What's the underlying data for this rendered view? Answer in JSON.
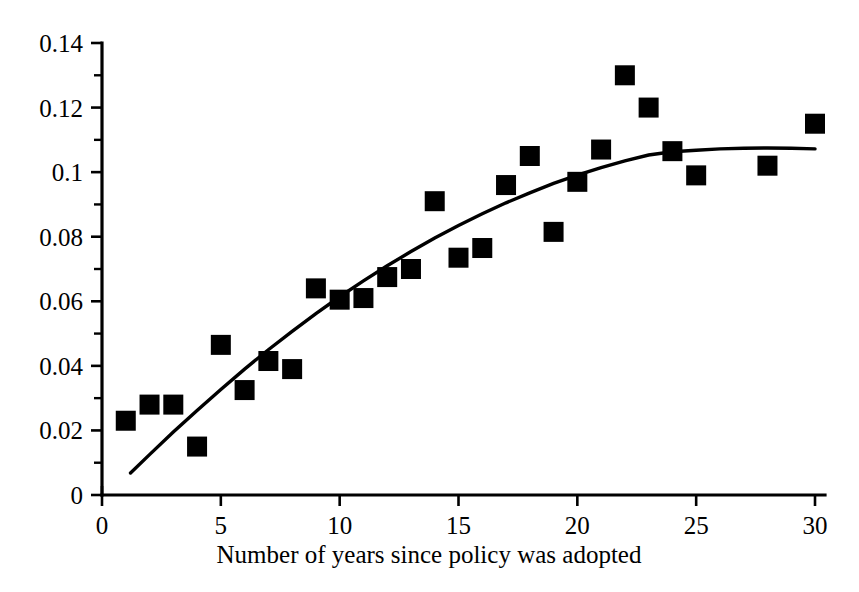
{
  "chart_data": {
    "type": "scatter",
    "title": "",
    "xlabel": "Number of years since policy was adopted",
    "ylabel": "",
    "xlim": [
      0,
      30
    ],
    "ylim": [
      0,
      0.14
    ],
    "grid": false,
    "legend": "none",
    "x_ticks": [
      0,
      5,
      10,
      15,
      20,
      25,
      30
    ],
    "x_tick_labels": [
      "0",
      "5",
      "10",
      "15",
      "20",
      "25",
      "30"
    ],
    "x_minor_ticks": [],
    "y_ticks": [
      0,
      0.02,
      0.04,
      0.06,
      0.08,
      0.1,
      0.12,
      0.14
    ],
    "y_tick_labels": [
      "0",
      "0.02",
      "0.04",
      "0.06",
      "0.08",
      "0.1",
      "0.12",
      "0.14"
    ],
    "y_minor_ticks": [
      0.01,
      0.03,
      0.05,
      0.07,
      0.09,
      0.11,
      0.13
    ],
    "marker_style": "filled-square",
    "marker_color": "#000000",
    "marker_size_px": 20,
    "x": [
      1,
      2,
      3,
      4,
      5,
      6,
      7,
      8,
      9,
      10,
      11,
      12,
      13,
      14,
      15,
      16,
      17,
      18,
      19,
      20,
      21,
      22,
      23,
      24,
      25,
      28,
      30
    ],
    "y": [
      0.023,
      0.028,
      0.028,
      0.015,
      0.0465,
      0.0325,
      0.0415,
      0.039,
      0.064,
      0.0605,
      0.061,
      0.0675,
      0.07,
      0.091,
      0.0735,
      0.0765,
      0.096,
      0.105,
      0.0815,
      0.097,
      0.107,
      0.13,
      0.12,
      0.1065,
      0.099,
      0.102,
      0.115
    ],
    "series": [
      {
        "name": "observations",
        "type": "scatter",
        "points": [
          {
            "x": 1,
            "y": 0.023
          },
          {
            "x": 2,
            "y": 0.028
          },
          {
            "x": 3,
            "y": 0.028
          },
          {
            "x": 4,
            "y": 0.015
          },
          {
            "x": 5,
            "y": 0.0465
          },
          {
            "x": 6,
            "y": 0.0325
          },
          {
            "x": 7,
            "y": 0.0415
          },
          {
            "x": 8,
            "y": 0.039
          },
          {
            "x": 9,
            "y": 0.064
          },
          {
            "x": 10,
            "y": 0.0605
          },
          {
            "x": 11,
            "y": 0.061
          },
          {
            "x": 12,
            "y": 0.0675
          },
          {
            "x": 13,
            "y": 0.07
          },
          {
            "x": 14,
            "y": 0.091
          },
          {
            "x": 15,
            "y": 0.0735
          },
          {
            "x": 16,
            "y": 0.0765
          },
          {
            "x": 17,
            "y": 0.096
          },
          {
            "x": 18,
            "y": 0.105
          },
          {
            "x": 19,
            "y": 0.0815
          },
          {
            "x": 20,
            "y": 0.097
          },
          {
            "x": 21,
            "y": 0.107
          },
          {
            "x": 22,
            "y": 0.13
          },
          {
            "x": 23,
            "y": 0.12
          },
          {
            "x": 24,
            "y": 0.1065
          },
          {
            "x": 25,
            "y": 0.099
          },
          {
            "x": 28,
            "y": 0.102
          },
          {
            "x": 30,
            "y": 0.115
          }
        ]
      },
      {
        "name": "fitted-curve",
        "type": "line",
        "points": [
          {
            "x": 1.2,
            "y": 0.0068
          },
          {
            "x": 2,
            "y": 0.0125
          },
          {
            "x": 3,
            "y": 0.0195
          },
          {
            "x": 4,
            "y": 0.0262
          },
          {
            "x": 5,
            "y": 0.0327
          },
          {
            "x": 6,
            "y": 0.039
          },
          {
            "x": 7,
            "y": 0.045
          },
          {
            "x": 8,
            "y": 0.0507
          },
          {
            "x": 9,
            "y": 0.0562
          },
          {
            "x": 10,
            "y": 0.0614
          },
          {
            "x": 11,
            "y": 0.0663
          },
          {
            "x": 12,
            "y": 0.071
          },
          {
            "x": 13,
            "y": 0.0754
          },
          {
            "x": 14,
            "y": 0.0796
          },
          {
            "x": 15,
            "y": 0.0835
          },
          {
            "x": 16,
            "y": 0.0871
          },
          {
            "x": 17,
            "y": 0.0905
          },
          {
            "x": 18,
            "y": 0.0936
          },
          {
            "x": 19,
            "y": 0.0965
          },
          {
            "x": 20,
            "y": 0.0991
          },
          {
            "x": 21,
            "y": 0.1014
          },
          {
            "x": 22,
            "y": 0.1035
          },
          {
            "x": 23,
            "y": 0.1053
          },
          {
            "x": 24,
            "y": 0.1063
          },
          {
            "x": 25,
            "y": 0.1068
          },
          {
            "x": 26,
            "y": 0.1072
          },
          {
            "x": 27,
            "y": 0.1074
          },
          {
            "x": 28,
            "y": 0.1075
          },
          {
            "x": 29,
            "y": 0.1074
          },
          {
            "x": 30,
            "y": 0.1072
          }
        ]
      }
    ]
  },
  "axis": {
    "x_title": "Number of years since policy was adopted"
  },
  "colors": {
    "foreground": "#000000",
    "background": "#ffffff"
  }
}
